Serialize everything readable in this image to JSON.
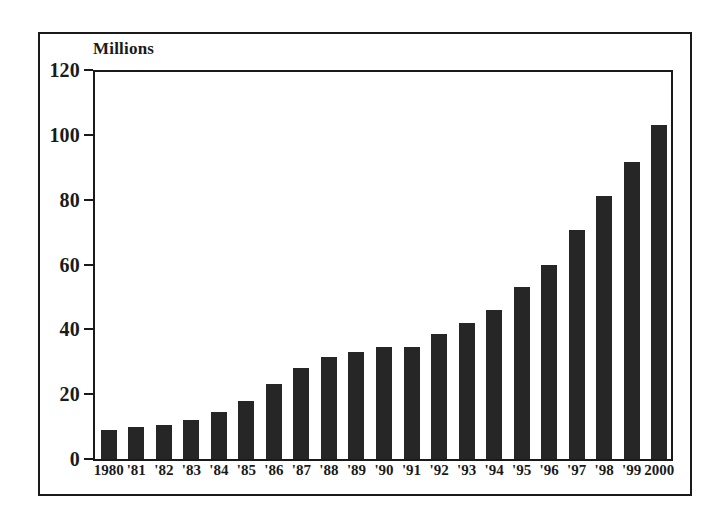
{
  "chart_data": {
    "type": "bar",
    "title": "",
    "axis_unit_label": "Millions",
    "xlabel": "",
    "ylabel": "Millions",
    "ylim": [
      0,
      120
    ],
    "ytick_step": 20,
    "yticks": [
      0,
      20,
      40,
      60,
      80,
      100,
      120
    ],
    "ytick_labels": [
      "0",
      "20",
      "40",
      "60",
      "80",
      "100",
      "120"
    ],
    "grid": false,
    "legend": false,
    "bar_color": "#262626",
    "categories": [
      "1980",
      "'81",
      "'82",
      "'83",
      "'84",
      "'85",
      "'86",
      "'87",
      "'88",
      "'89",
      "'90",
      "'91",
      "'92",
      "'93",
      "'94",
      "'95",
      "'96",
      "'97",
      "'98",
      "'99",
      "2000"
    ],
    "values": [
      9,
      10,
      10.5,
      12,
      14.5,
      18,
      23,
      28,
      31.5,
      33,
      34.5,
      34.5,
      38.5,
      42,
      46,
      53,
      60,
      70.5,
      81,
      91.5,
      103
    ]
  },
  "figure": {
    "frame_color": "#1a1a1a",
    "background_color": "#ffffff"
  }
}
